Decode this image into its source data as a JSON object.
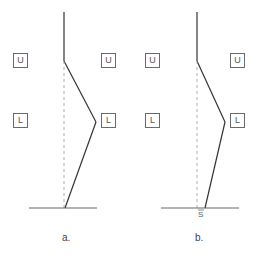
{
  "panels": [
    {
      "caption": "a.",
      "boxes": [
        {
          "label": "U"
        },
        {
          "label": "L"
        },
        {
          "label": "U"
        },
        {
          "label": "L"
        }
      ]
    },
    {
      "caption": "b.",
      "boxes": [
        {
          "label": "U"
        },
        {
          "label": "L"
        },
        {
          "label": "U"
        },
        {
          "label": "L"
        }
      ],
      "offset_label": "S"
    }
  ],
  "colors": {
    "line": "#333333",
    "dashed": "#999999",
    "box_border": "#6a6a6a"
  }
}
